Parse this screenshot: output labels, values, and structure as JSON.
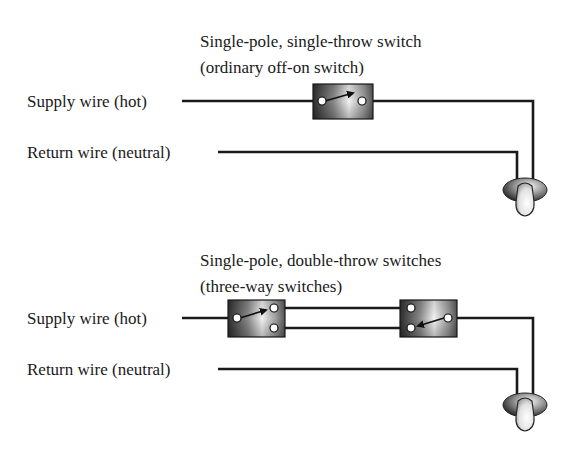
{
  "top_circuit": {
    "caption_line1": "Single-pole, single-throw switch",
    "caption_line2": "(ordinary off-on switch)",
    "supply_label": "Supply wire (hot)",
    "return_label": "Return wire (neutral)",
    "switch_type": "SPST",
    "switch_icon": "spst-switch-icon",
    "load_icon": "light-bulb-icon"
  },
  "bottom_circuit": {
    "caption_line1": "Single-pole, double-throw switches",
    "caption_line2": "(three-way switches)",
    "supply_label": "Supply wire (hot)",
    "return_label": "Return wire (neutral)",
    "switch_type": "SPDT",
    "switch_count": 2,
    "switch_icon": "spdt-switch-icon",
    "load_icon": "light-bulb-icon"
  },
  "colors": {
    "wire": "#1a1a1a",
    "switch_dark": "#3a3a3a",
    "switch_light": "#f0f0f0",
    "terminal": "#ffffff",
    "background": "#ffffff"
  }
}
